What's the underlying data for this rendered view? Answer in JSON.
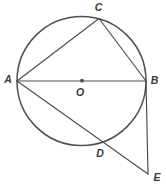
{
  "diagram": {
    "type": "geometry-circle-figure",
    "stroke_color": "#4f4f4f",
    "label_color": "#3a3a3a",
    "background_color": "#ffffff",
    "circle": {
      "cx": 81.5,
      "cy": 81,
      "r": 64.5,
      "stroke_width": 1.5
    },
    "center_dot": {
      "x": 82,
      "y": 80.7,
      "r": 1.9
    },
    "line_stroke_width": 1.2,
    "points": {
      "A": {
        "x": 17,
        "y": 81
      },
      "B": {
        "x": 146,
        "y": 81
      },
      "C": {
        "x": 99,
        "y": 18.5
      },
      "D": {
        "x": 103.5,
        "y": 142
      },
      "E": {
        "x": 148,
        "y": 174
      },
      "O": {
        "x": 82,
        "y": 80.7
      }
    },
    "segments": [
      {
        "from": "A",
        "to": "B"
      },
      {
        "from": "A",
        "to": "C"
      },
      {
        "from": "C",
        "to": "B"
      },
      {
        "from": "A",
        "to": "E"
      },
      {
        "from": "B",
        "to": "E"
      }
    ],
    "labels": [
      {
        "text": "A",
        "x": 8,
        "y": 78.5
      },
      {
        "text": "B",
        "x": 154.5,
        "y": 80
      },
      {
        "text": "C",
        "x": 98.5,
        "y": 6.5
      },
      {
        "text": "O",
        "x": 80,
        "y": 91.5
      },
      {
        "text": "D",
        "x": 100,
        "y": 153
      },
      {
        "text": "E",
        "x": 157,
        "y": 176.5
      }
    ]
  }
}
